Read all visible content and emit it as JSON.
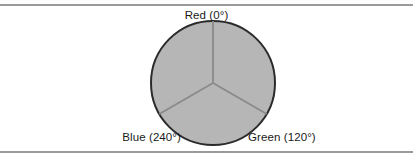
{
  "figure": {
    "background_color": "#ffffff",
    "rule_color": "#9a9a9a",
    "width": 413,
    "height": 161
  },
  "labels": {
    "red": "Red (0°)",
    "green": "Green (120°)",
    "blue": "Blue (240°)"
  },
  "chart_data": {
    "type": "pie",
    "title": "",
    "subtitle": "",
    "xlabel": "",
    "ylabel": "",
    "legend_position": "none",
    "grid": false,
    "categories": [
      "Red (0°)",
      "Green (120°)",
      "Blue (240°)"
    ],
    "values": [
      120,
      120,
      120
    ],
    "value_unit": "degrees",
    "start_angle_deg": 0,
    "direction": "clockwise",
    "annotations": [
      {
        "text": "Red (0°)",
        "angle_deg": 0,
        "position": "top"
      },
      {
        "text": "Green (120°)",
        "angle_deg": 120,
        "position": "bottom-right"
      },
      {
        "text": "Blue (240°)",
        "angle_deg": 240,
        "position": "bottom-left"
      }
    ],
    "slice_fill_color": "#b6b6b6",
    "outline_color": "#2b2b2b",
    "divider_color": "#8a8a8a",
    "center_x": 213,
    "center_y": 83,
    "radius": 62
  }
}
